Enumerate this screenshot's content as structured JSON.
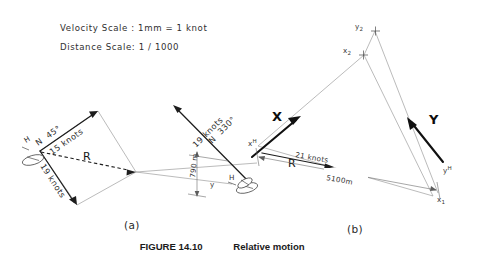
{
  "figure": {
    "caption_label": "FIGURE 14.10",
    "caption_title": "Relative motion",
    "part_a_label": "(a)",
    "part_b_label": "(b)"
  },
  "scales": {
    "velocity": "Velocity Scale : 1mm = 1 knot",
    "distance": "Distance Scale: 1 / 1000"
  },
  "diagram_a": {
    "ship_h_label": "H",
    "ship_y_label": "y",
    "ship_h2_label": "H",
    "course_1_bearing": "N  45°",
    "course_1_speed": "15 knots",
    "course_2_speed": "19 knots",
    "course_3_bearing": "N  330°",
    "course_3_speed": "19 knots",
    "resultant_label": "R",
    "distance_label": "790 m"
  },
  "diagram_b": {
    "vector_x_label": "X",
    "vector_y_label": "Y",
    "point_x_h": "x",
    "point_x_h_sub": "H",
    "point_y_h": "y",
    "point_y_h_sub": "H",
    "point_x_1": "x",
    "point_x_1_sub": "1",
    "point_x_2": "x",
    "point_x_2_sub": "2",
    "point_y_2": "y",
    "point_y_2_sub": "2",
    "resultant_label": "R",
    "resultant_speed": "21 knots",
    "range_label": "5100m"
  },
  "colors": {
    "background": "#ffffff",
    "ink": "#1a1a1a",
    "thin_line": "#8d8d8d",
    "bold_vector": "#111111"
  }
}
